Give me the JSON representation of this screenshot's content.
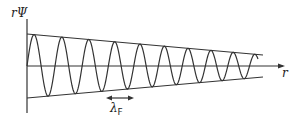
{
  "diagram": {
    "y_axis_label": "rΨ",
    "x_axis_label": "r",
    "wavelength_label": "λ",
    "wavelength_subscript": "F",
    "colors": {
      "line": "#333333",
      "background": "#ffffff"
    }
  }
}
